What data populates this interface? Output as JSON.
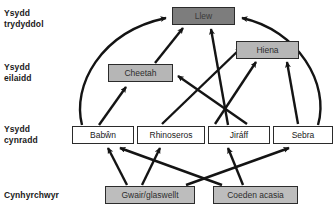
{
  "diagram": {
    "tiers": [
      {
        "id": "tertiary",
        "label": "Ysydd\ntrydyddol",
        "x": 4,
        "y": 8,
        "level_color": "#7d7d7d"
      },
      {
        "id": "secondary",
        "label": "Ysydd\neilaidd",
        "x": 4,
        "y": 62,
        "level_color": "#b6b6b6"
      },
      {
        "id": "primary",
        "label": "Ysydd\ncynradd",
        "x": 4,
        "y": 124,
        "level_color": "#ffffff"
      },
      {
        "id": "producer",
        "label": "Cynhyrchwyr",
        "x": 4,
        "y": 190,
        "level_color": "#bdbdbd"
      }
    ],
    "nodes": [
      {
        "id": "llew",
        "label": "Llew",
        "tier": "tertiary",
        "x": 172,
        "y": 7,
        "w": 63,
        "h": 18
      },
      {
        "id": "hiena",
        "label": "Hiena",
        "tier": "secondary",
        "x": 236,
        "y": 41,
        "w": 63,
        "h": 18
      },
      {
        "id": "cheetah",
        "label": "Cheetah",
        "tier": "secondary",
        "x": 108,
        "y": 64,
        "w": 65,
        "h": 18
      },
      {
        "id": "babwn",
        "label": "Babŵn",
        "tier": "primary",
        "x": 72,
        "y": 126,
        "w": 62,
        "h": 18
      },
      {
        "id": "rhino",
        "label": "Rhinoseros",
        "tier": "primary",
        "x": 137,
        "y": 126,
        "w": 68,
        "h": 18
      },
      {
        "id": "jiraff",
        "label": "Jiráff",
        "tier": "primary",
        "x": 208,
        "y": 126,
        "w": 62,
        "h": 18
      },
      {
        "id": "sebra",
        "label": "Sebra",
        "tier": "primary",
        "x": 273,
        "y": 126,
        "w": 60,
        "h": 18
      },
      {
        "id": "gwair",
        "label": "Gwair/glaswellt",
        "tier": "producer",
        "x": 105,
        "y": 186,
        "w": 90,
        "h": 18
      },
      {
        "id": "acasia",
        "label": "Coeden acasia",
        "tier": "producer",
        "x": 213,
        "y": 186,
        "w": 85,
        "h": 18
      }
    ],
    "links": [
      {
        "from": "babwn",
        "to": "llew",
        "style": "curve-left"
      },
      {
        "from": "sebra",
        "to": "llew",
        "style": "curve-right"
      },
      {
        "from": "babwn",
        "to": "cheetah",
        "style": "straight"
      },
      {
        "from": "cheetah",
        "to": "llew",
        "style": "straight"
      },
      {
        "from": "jiraff",
        "to": "llew",
        "style": "straight"
      },
      {
        "from": "jiraff",
        "to": "cheetah",
        "style": "straight"
      },
      {
        "from": "rhino",
        "to": "hiena",
        "style": "straight"
      },
      {
        "from": "jiraff",
        "to": "hiena",
        "style": "straight"
      },
      {
        "from": "sebra",
        "to": "hiena",
        "style": "straight"
      },
      {
        "from": "gwair",
        "to": "babwn",
        "style": "straight"
      },
      {
        "from": "gwair",
        "to": "rhino",
        "style": "straight"
      },
      {
        "from": "gwair",
        "to": "sebra",
        "style": "straight"
      },
      {
        "from": "acasia",
        "to": "babwn",
        "style": "straight"
      },
      {
        "from": "acasia",
        "to": "jiraff",
        "style": "straight"
      }
    ],
    "colors": {
      "arrow": "#141414",
      "border": "#2b2b2b",
      "text": "#1a1a1a",
      "background": "#ffffff"
    }
  }
}
